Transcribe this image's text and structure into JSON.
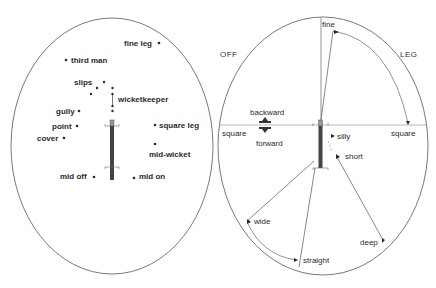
{
  "colors": {
    "ink": "#2a2a2a",
    "line": "#555555",
    "bat": "#444444",
    "background": "#ffffff"
  },
  "left_field": {
    "title": "Fielding positions",
    "fielders": [
      {
        "label": "fine leg",
        "side": "right"
      },
      {
        "label": "third man",
        "side": "right"
      },
      {
        "label": "slips",
        "side": "left"
      },
      {
        "label": "wicketkeeper",
        "side": "right"
      },
      {
        "label": "gully",
        "side": "left"
      },
      {
        "label": "point",
        "side": "left"
      },
      {
        "label": "cover",
        "side": "left"
      },
      {
        "label": "square leg",
        "side": "right"
      },
      {
        "label": "mid-wicket",
        "side": "below"
      },
      {
        "label": "mid off",
        "side": "left"
      },
      {
        "label": "mid on",
        "side": "right"
      }
    ]
  },
  "right_field": {
    "side_labels": {
      "off": "OFF",
      "leg": "LEG"
    },
    "terms": {
      "fine": "fine",
      "square_off": "square",
      "square_leg": "square",
      "backward": "backward",
      "forward": "forward",
      "silly": "silly",
      "short": "short",
      "deep": "deep",
      "wide": "wide",
      "straight": "straight"
    }
  }
}
